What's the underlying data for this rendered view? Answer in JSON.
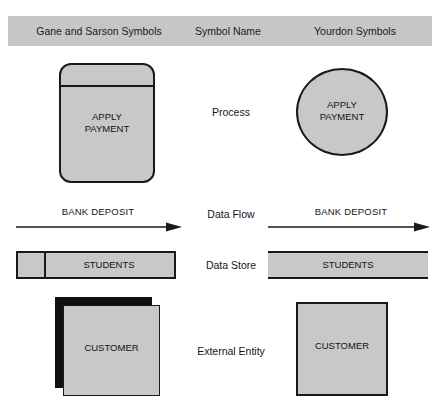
{
  "header": {
    "columns": [
      {
        "label": "Gane and Sarson Symbols"
      },
      {
        "label": "Symbol Name"
      },
      {
        "label": "Yourdon Symbols"
      }
    ],
    "background_color": "#c6c6c6"
  },
  "rows": [
    {
      "name": "Process",
      "gane_sarson": {
        "shape": "rounded-rectangle-with-band",
        "text": "APPLY\nPAYMENT"
      },
      "yourdon": {
        "shape": "circle",
        "text": "APPLY\nPAYMENT"
      }
    },
    {
      "name": "Data Flow",
      "gane_sarson": {
        "shape": "arrow",
        "text": "BANK DEPOSIT"
      },
      "yourdon": {
        "shape": "arrow",
        "text": "BANK DEPOSIT"
      }
    },
    {
      "name": "Data Store",
      "gane_sarson": {
        "shape": "rectangle-with-id-compartment",
        "text": "STUDENTS"
      },
      "yourdon": {
        "shape": "open-ended-bar",
        "text": "STUDENTS"
      }
    },
    {
      "name": "External Entity",
      "gane_sarson": {
        "shape": "shadowed-rectangle",
        "text": "CUSTOMER"
      },
      "yourdon": {
        "shape": "rectangle",
        "text": "CUSTOMER"
      }
    }
  ],
  "colors": {
    "shape_fill": "#c8c8c8",
    "shape_stroke": "#1a1a1a",
    "header_fill": "#c6c6c6",
    "text": "#131313"
  },
  "bottom_caption": ""
}
